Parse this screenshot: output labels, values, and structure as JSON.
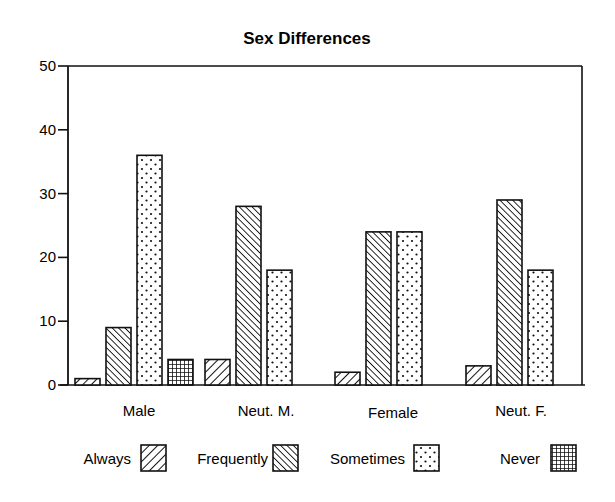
{
  "chart_data": {
    "type": "bar",
    "title": "Sex Differences",
    "xlabel": "",
    "ylabel": "",
    "ylim": [
      0,
      50
    ],
    "yticks": [
      0,
      10,
      20,
      30,
      40,
      50
    ],
    "ytick_labels": [
      "0",
      "10",
      "20",
      "30",
      "40",
      "50"
    ],
    "grid": false,
    "legend_position": "bottom",
    "categories": [
      "Male",
      "Neut. M.",
      "Female",
      "Neut. F."
    ],
    "series": [
      {
        "name": "Always",
        "pattern": "hatch-forward",
        "values": [
          1,
          4,
          2,
          3
        ]
      },
      {
        "name": "Frequently",
        "pattern": "hatch-back",
        "values": [
          9,
          28,
          24,
          29
        ]
      },
      {
        "name": "Sometimes",
        "pattern": "dots",
        "values": [
          36,
          18,
          24,
          18
        ]
      },
      {
        "name": "Never",
        "pattern": "grid",
        "values": [
          4,
          0,
          0,
          0
        ]
      }
    ],
    "colors": {
      "ink": "#111111",
      "background": "#ffffff"
    }
  }
}
